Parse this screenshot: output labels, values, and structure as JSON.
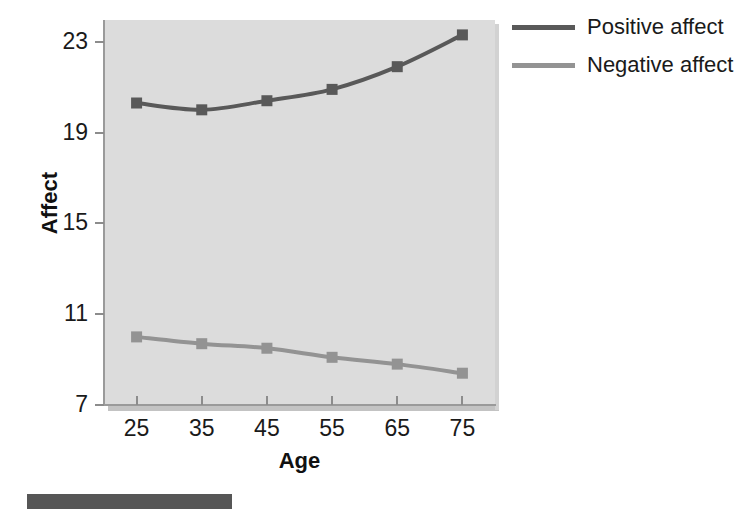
{
  "chart_data": {
    "type": "line",
    "title": "",
    "xlabel": "Age",
    "ylabel": "Affect",
    "x": [
      25,
      35,
      45,
      55,
      65,
      75
    ],
    "xticklabels": [
      "25",
      "35",
      "45",
      "55",
      "65",
      "75"
    ],
    "yticklabels": [
      "23",
      "19",
      "15",
      "11",
      "7"
    ],
    "yticks": [
      23,
      19,
      15,
      11,
      7
    ],
    "xlim": [
      20,
      80
    ],
    "ylim": [
      7,
      24.2
    ],
    "grid": false,
    "legend_position": "right-top",
    "plot_background": "#dcdcdc",
    "series": [
      {
        "name": "Positive affect",
        "color": "#595959",
        "marker": "square",
        "values": [
          20.3,
          20.0,
          20.4,
          20.9,
          21.9,
          23.3
        ]
      },
      {
        "name": "Negative affect",
        "color": "#939393",
        "marker": "square",
        "values": [
          10.0,
          9.7,
          9.5,
          9.1,
          8.8,
          8.4
        ]
      }
    ]
  },
  "axes": {
    "y_title": "Affect",
    "x_title": "Age"
  },
  "legend": {
    "items": [
      {
        "label": "Positive affect",
        "color": "#595959"
      },
      {
        "label": "Negative affect",
        "color": "#939393"
      }
    ]
  },
  "footer": {
    "bar_color": "#565656"
  }
}
